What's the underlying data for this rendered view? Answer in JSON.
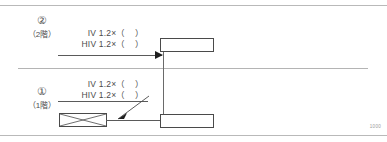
{
  "diagram": {
    "title": "",
    "corner_code": "1000",
    "colors": {
      "line": "#4a4a4a",
      "rule": "#b9b9b9",
      "text": "#4b4b4b",
      "arrow": "#1e1e1e",
      "background": "#ffffff"
    },
    "rules": {
      "top_label": "top-border-rule",
      "bottom_label": "bottom-border-rule",
      "floor_divider_label": "floor-divider-line"
    },
    "floors": [
      {
        "id": "floor-2",
        "marker": "②",
        "name": "（2階）",
        "specs": [
          "IV 1.2×（　）",
          "HIV 1.2×（　）"
        ],
        "feeder_label": "feeder-line-floor-2",
        "box_label": "equipment-box-floor-2"
      },
      {
        "id": "floor-1",
        "marker": "①",
        "name": "（1階）",
        "specs": [
          "IV 1.2×（　）",
          "HIV 1.2×（　）"
        ],
        "feeder_label": "feeder-line-floor-1",
        "box_label": "equipment-box-floor-1"
      }
    ],
    "symbols": {
      "distribution_board": "distribution-board-symbol",
      "riser": "vertical-riser-line",
      "arrowhead": "feeder-arrowhead",
      "leader": "leader-arrow-to-board"
    }
  }
}
